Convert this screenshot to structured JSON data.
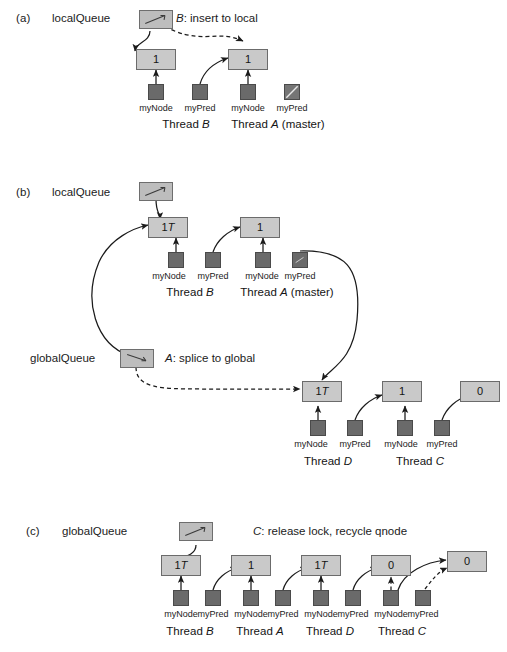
{
  "figure": {
    "colors": {
      "node_fill": "#c9c9c9",
      "node_border": "#6b6b6b",
      "pointer_fill": "#6a6a6a",
      "queue_fill": "#bdbdbd",
      "line": "#1b1b1b",
      "background": "#ffffff"
    }
  },
  "panels": [
    {
      "id": "a",
      "label": "(a)",
      "queue_label": "localQueue",
      "action": {
        "actor": "B",
        "text": ": insert to local"
      },
      "nodes": [
        {
          "value": "1",
          "tagged": false
        },
        {
          "value": "1",
          "tagged": false
        }
      ],
      "pointers": [
        {
          "field": "myNode",
          "null": false
        },
        {
          "field": "myPred",
          "null": false
        },
        {
          "field": "myNode",
          "null": false
        },
        {
          "field": "myPred",
          "null": true
        }
      ],
      "threads": [
        {
          "prefix": "Thread ",
          "name": "B",
          "suffix": ""
        },
        {
          "prefix": "Thread ",
          "name": "A",
          "suffix": " (master)"
        }
      ]
    },
    {
      "id": "b",
      "label": "(b)",
      "queue_label": "localQueue",
      "queue_label_2": "globalQueue",
      "action": {
        "actor": "A",
        "text": ": splice to global"
      },
      "local_nodes": [
        {
          "value": "1",
          "tagged": true
        },
        {
          "value": "1",
          "tagged": false
        }
      ],
      "local_pointers": [
        {
          "field": "myNode",
          "null": false
        },
        {
          "field": "myPred",
          "null": false
        },
        {
          "field": "myNode",
          "null": false
        },
        {
          "field": "myPred",
          "null": false
        }
      ],
      "local_threads": [
        {
          "prefix": "Thread ",
          "name": "B",
          "suffix": ""
        },
        {
          "prefix": "Thread ",
          "name": "A",
          "suffix": " (master)"
        }
      ],
      "global_nodes": [
        {
          "value": "1",
          "tagged": true
        },
        {
          "value": "1",
          "tagged": false
        },
        {
          "value": "0",
          "tagged": false
        }
      ],
      "global_pointers": [
        {
          "field": "myNode",
          "null": false
        },
        {
          "field": "myPred",
          "null": false
        },
        {
          "field": "myNode",
          "null": false
        },
        {
          "field": "myPred",
          "null": false
        }
      ],
      "global_threads": [
        {
          "prefix": "Thread ",
          "name": "D",
          "suffix": ""
        },
        {
          "prefix": "Thread ",
          "name": "C",
          "suffix": ""
        }
      ]
    },
    {
      "id": "c",
      "label": "(c)",
      "queue_label": "globalQueue",
      "action": {
        "actor": "C",
        "text": ": release lock, recycle qnode"
      },
      "nodes": [
        {
          "value": "1",
          "tagged": true
        },
        {
          "value": "1",
          "tagged": false
        },
        {
          "value": "1",
          "tagged": true
        },
        {
          "value": "0",
          "tagged": false
        },
        {
          "value": "0",
          "tagged": false
        }
      ],
      "pointers": [
        {
          "field": "myNode",
          "null": false
        },
        {
          "field": "myPred",
          "null": false
        },
        {
          "field": "myNode",
          "null": false
        },
        {
          "field": "myPred",
          "null": false
        },
        {
          "field": "myNode",
          "null": false
        },
        {
          "field": "myPred",
          "null": false
        },
        {
          "field": "myNode",
          "null": false
        },
        {
          "field": "myPred",
          "null": false
        }
      ],
      "threads": [
        {
          "prefix": "Thread ",
          "name": "B",
          "suffix": ""
        },
        {
          "prefix": "Thread ",
          "name": "A",
          "suffix": ""
        },
        {
          "prefix": "Thread ",
          "name": "D",
          "suffix": ""
        },
        {
          "prefix": "Thread ",
          "name": "C",
          "suffix": ""
        }
      ]
    }
  ],
  "tag_suffix": "T"
}
